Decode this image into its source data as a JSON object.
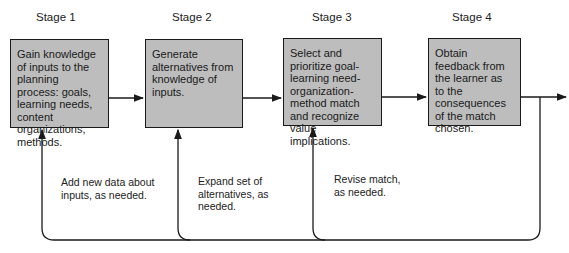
{
  "stages": [
    {
      "label": "Stage 1",
      "text": "Gain knowledge of inputs to the planning process: goals, learning needs, content organizations, methods."
    },
    {
      "label": "Stage 2",
      "text": "Generate alternatives from knowledge of inputs."
    },
    {
      "label": "Stage 3",
      "text": "Select and prioritize goal-learning need-organization-method match and recognize value implications."
    },
    {
      "label": "Stage 4",
      "text": "Obtain feedback from the learner as to the consequences of the match chosen."
    }
  ],
  "feedback_notes": [
    {
      "text": "Add new data about inputs, as needed."
    },
    {
      "text": "Expand set of alternatives, as needed."
    },
    {
      "text": "Revise match, as needed."
    }
  ],
  "colors": {
    "box_fill": "#bdbdbd",
    "line": "#1a1a1a",
    "background": "#ffffff"
  }
}
